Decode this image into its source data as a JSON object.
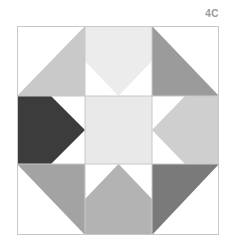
{
  "label": "4C",
  "block": {
    "grid": "3x3",
    "outline_color": "#c8c8c8",
    "background_color": "#ffffff",
    "cells": [
      {
        "id": "top-left",
        "shape": "half-square-triangle",
        "filled_half": "lower-right",
        "color": "#c9c9c9"
      },
      {
        "id": "top-center",
        "shape": "pentagon-point-down",
        "color": "#ececec"
      },
      {
        "id": "top-right",
        "shape": "half-square-triangle",
        "filled_half": "lower-left",
        "color": "#9b9b9b"
      },
      {
        "id": "middle-left",
        "shape": "pentagon-point-right",
        "color": "#3c3c3c"
      },
      {
        "id": "center",
        "shape": "square",
        "color": "#e9e9e9"
      },
      {
        "id": "middle-right",
        "shape": "pentagon-point-left",
        "color": "#cfcfcf"
      },
      {
        "id": "bottom-left",
        "shape": "half-square-triangle",
        "filled_half": "upper-right",
        "color": "#a3a3a3"
      },
      {
        "id": "bottom-center",
        "shape": "pentagon-point-up",
        "color": "#b3b3b3"
      },
      {
        "id": "bottom-right",
        "shape": "half-square-triangle",
        "filled_half": "upper-left",
        "color": "#7a7a7a"
      }
    ]
  }
}
